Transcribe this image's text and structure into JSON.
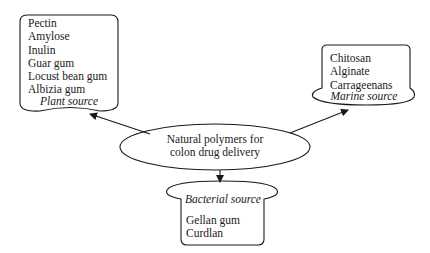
{
  "diagram": {
    "center": {
      "line1": "Natural polymers for",
      "line2": "colon drug delivery"
    },
    "plant": {
      "label": "Plant source",
      "items": [
        "Pectin",
        "Amylose",
        "Inulin",
        "Guar gum",
        "Locust bean gum",
        "Albizia gum"
      ]
    },
    "marine": {
      "label": "Marine source",
      "items": [
        "Chitosan",
        "Alginate",
        "Carrageenans"
      ]
    },
    "bacterial": {
      "label": "Bacterial source",
      "items": [
        "Gellan gum",
        "Curdlan"
      ]
    },
    "colors": {
      "stroke": "#1a1a1a",
      "background": "#ffffff"
    }
  }
}
